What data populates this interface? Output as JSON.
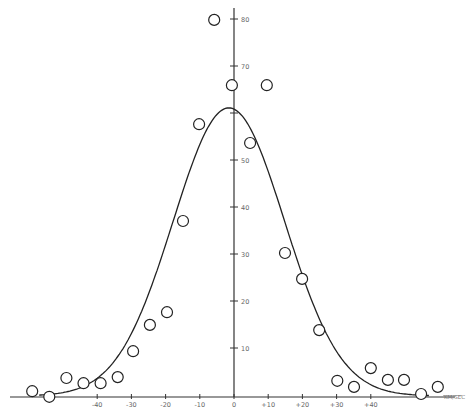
{
  "chart_data": {
    "type": "scatter",
    "title": "",
    "xlabel": "KM/SEC",
    "ylabel": "",
    "xlim": [
      -68,
      62
    ],
    "ylim": [
      0,
      82
    ],
    "grid": false,
    "legend": null,
    "x_ticks": [
      -40,
      -30,
      -20,
      -10,
      0,
      10,
      20,
      30,
      40
    ],
    "x_tick_labels": [
      "-40",
      "-30",
      "-20",
      "-10",
      "0",
      "+10",
      "+20",
      "+30",
      "+40"
    ],
    "y_ticks": [
      10,
      20,
      30,
      40,
      50,
      60,
      70,
      80
    ],
    "y_tick_labels": [
      "10",
      "20",
      "30",
      "40",
      "50",
      "",
      "70",
      "80"
    ],
    "series": [
      {
        "name": "observed",
        "marker": "open-circle",
        "points": [
          [
            -59,
            0.6
          ],
          [
            -54,
            -0.6
          ],
          [
            -49,
            3.4
          ],
          [
            -44,
            2.3
          ],
          [
            -39,
            2.3
          ],
          [
            -34,
            3.6
          ],
          [
            -29.5,
            9.1
          ],
          [
            -24.6,
            14.7
          ],
          [
            -19.6,
            17.4
          ],
          [
            -14.9,
            36.8
          ],
          [
            -10.2,
            57.4
          ],
          [
            -5.8,
            79.6
          ],
          [
            -0.6,
            65.7
          ],
          [
            4.7,
            53.4
          ],
          [
            9.6,
            65.7
          ],
          [
            14.9,
            30.0
          ],
          [
            19.9,
            24.5
          ],
          [
            24.9,
            13.6
          ],
          [
            30.2,
            2.8
          ],
          [
            35.1,
            1.5
          ],
          [
            40.0,
            5.5
          ],
          [
            45.0,
            3.0
          ],
          [
            49.7,
            3.0
          ],
          [
            54.7,
            0.0
          ],
          [
            59.6,
            1.5
          ]
        ]
      },
      {
        "name": "gaussian-fit",
        "type": "line",
        "peak": 61.3,
        "center": -1.5,
        "sigma": 16.3,
        "x_range": [
          -57,
          57
        ]
      }
    ]
  },
  "axis": {
    "unit_label": "KM/SEC"
  }
}
